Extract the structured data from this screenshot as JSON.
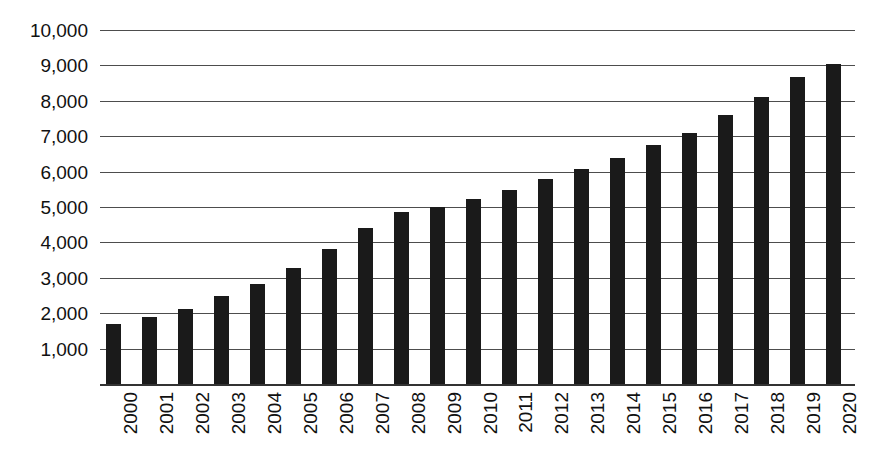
{
  "chart_data": {
    "type": "bar",
    "title": "",
    "subtitle": "",
    "xlabel": "",
    "ylabel": "",
    "categories": [
      "2000",
      "2001",
      "2002",
      "2003",
      "2004",
      "2005",
      "2006",
      "2007",
      "2008",
      "2009",
      "2010",
      "2011",
      "2012",
      "2013",
      "2014",
      "2015",
      "2016",
      "2017",
      "2018",
      "2019",
      "2020"
    ],
    "values": [
      1700,
      1880,
      2120,
      2480,
      2820,
      3280,
      3820,
      4400,
      4850,
      5000,
      5230,
      5480,
      5800,
      6080,
      6380,
      6750,
      7100,
      7600,
      8120,
      8680,
      9030
    ],
    "ylim": [
      0,
      10000
    ],
    "ytick_values": [
      1000,
      2000,
      3000,
      4000,
      5000,
      6000,
      7000,
      8000,
      9000,
      10000
    ],
    "ytick_labels": [
      "1,000",
      "2,000",
      "3,000",
      "4,000",
      "5,000",
      "6,000",
      "7,000",
      "8,000",
      "9,000",
      "10,000"
    ],
    "grid": true,
    "legend": false,
    "legend_position": "none",
    "bar_color": "#1a1a1a",
    "gridline_color": "#4d4d4d",
    "axis_color": "#333333",
    "background_color": "#ffffff"
  }
}
